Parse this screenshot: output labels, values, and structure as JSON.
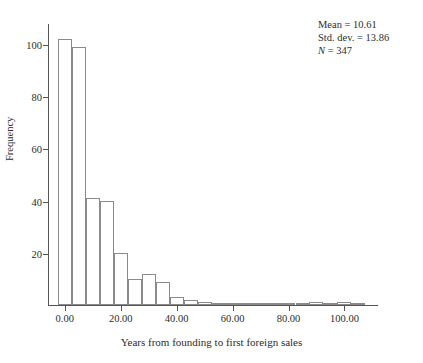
{
  "chart_data": {
    "type": "bar",
    "title": "",
    "subtitle": "",
    "xlabel": "Years from founding to first foreign sales",
    "ylabel": "Frequency",
    "grid": false,
    "legend": "none",
    "xlim": [
      -6,
      112
    ],
    "ylim": [
      0,
      108
    ],
    "xticks": [
      0,
      20,
      40,
      60,
      80,
      100
    ],
    "xtick_labels": [
      "0.00",
      "20.00",
      "40.00",
      "60.00",
      "80.00",
      "100.00"
    ],
    "yticks": [
      20,
      40,
      60,
      80,
      100
    ],
    "ytick_labels": [
      "20",
      "40",
      "60",
      "80",
      "100"
    ],
    "bin_width": 5,
    "bin_starts": [
      -2.5,
      2.5,
      7.5,
      12.5,
      17.5,
      22.5,
      27.5,
      32.5,
      37.5,
      42.5,
      47.5,
      52.5,
      57.5,
      62.5,
      67.5,
      72.5,
      77.5,
      82.5,
      87.5,
      92.5,
      97.5,
      102.5
    ],
    "bin_centers": [
      0,
      5,
      10,
      15,
      20,
      25,
      30,
      35,
      40,
      45,
      50,
      55,
      60,
      65,
      70,
      75,
      80,
      85,
      90,
      95,
      100,
      105
    ],
    "values": [
      102,
      99,
      41,
      40,
      20,
      10,
      12,
      9,
      3,
      2,
      1,
      0,
      0,
      0,
      0,
      0,
      0,
      0,
      1,
      0,
      1,
      0
    ],
    "bar_facecolor": "#ffffff",
    "bar_edgecolor": "#8a8a8a",
    "axis_color": "#555555",
    "text_color": "#2c2c2c"
  },
  "annotations": {
    "stats": {
      "mean_label": "Mean = 10.61",
      "stddev_label": "Std. dev. = 13.86",
      "n_symbol": "N",
      "n_value": " = 347"
    }
  }
}
